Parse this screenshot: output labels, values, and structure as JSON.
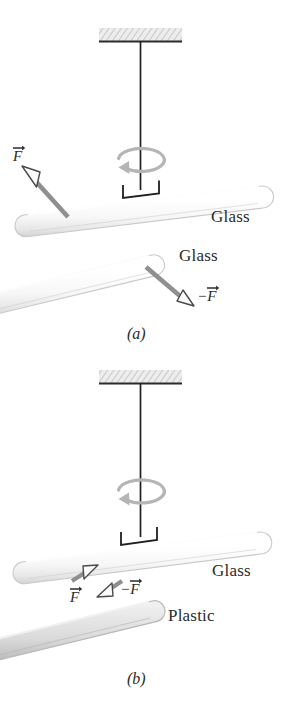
{
  "figure": {
    "background_color": "#ffffff",
    "ink_color": "#2b2b2b",
    "arrow_color": "#8c8c8c",
    "glass_color": "#fbfbfb",
    "plastic_color": "#dcdcdc",
    "ceiling_color": "#e3e3e3"
  },
  "panels": [
    {
      "id": "a",
      "caption": "(a)",
      "ceiling": {
        "name": "support-ceiling"
      },
      "thread": {
        "name": "suspension-thread"
      },
      "rotation": {
        "name": "rotation-arrow",
        "direction": "counterclockwise"
      },
      "clamp": {
        "name": "rod-clamp"
      },
      "rods": [
        {
          "name": "suspended-rod",
          "material": "Glass",
          "label": "Glass"
        },
        {
          "name": "handheld-rod",
          "material": "Glass",
          "label": "Glass"
        }
      ],
      "forces": [
        {
          "name": "force-vector-f",
          "label": "F",
          "sign": "",
          "on": "suspended-rod"
        },
        {
          "name": "force-vector-minus-f",
          "label": "F",
          "sign": "−",
          "on": "handheld-rod"
        }
      ]
    },
    {
      "id": "b",
      "caption": "(b)",
      "ceiling": {
        "name": "support-ceiling"
      },
      "thread": {
        "name": "suspension-thread"
      },
      "rotation": {
        "name": "rotation-arrow",
        "direction": "counterclockwise"
      },
      "clamp": {
        "name": "rod-clamp"
      },
      "rods": [
        {
          "name": "suspended-rod",
          "material": "Glass",
          "label": "Glass"
        },
        {
          "name": "handheld-rod",
          "material": "Plastic",
          "label": "Plastic"
        }
      ],
      "forces": [
        {
          "name": "force-vector-f",
          "label": "F",
          "sign": "",
          "on": "suspended-rod"
        },
        {
          "name": "force-vector-minus-f",
          "label": "F",
          "sign": "−",
          "on": "handheld-rod"
        }
      ]
    }
  ]
}
